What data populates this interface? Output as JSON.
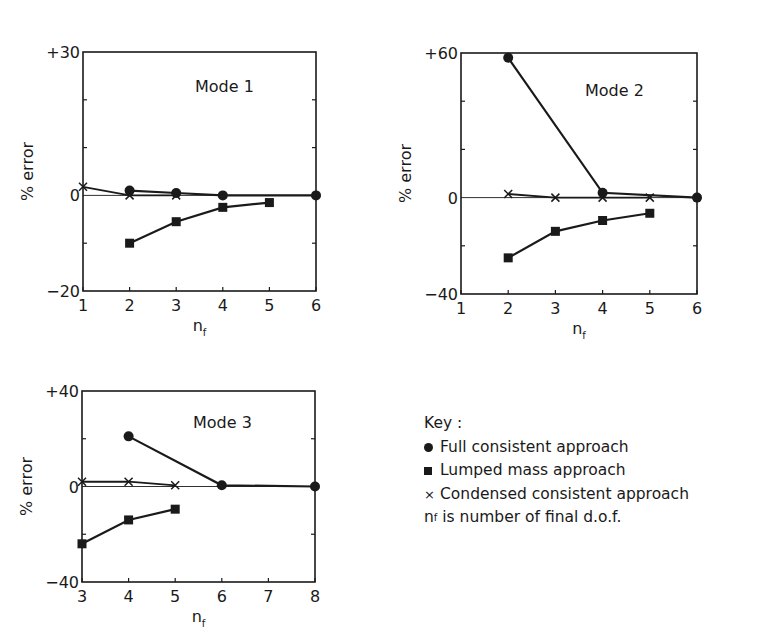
{
  "chart_data": [
    {
      "type": "line",
      "title": "Mode 1",
      "xlabel": "n_f",
      "ylabel": "% error",
      "xlim": [
        1,
        6
      ],
      "ylim": [
        -20,
        30
      ],
      "x_ticks": [
        1,
        2,
        3,
        4,
        5,
        6
      ],
      "y_tick_labels": [
        "+30",
        "0",
        "-20"
      ],
      "y_minor_ticks": [
        20,
        10,
        -10
      ],
      "grid": false,
      "zero_line": true,
      "box": {
        "x0": 83,
        "y0": 52,
        "x1": 316,
        "y1": 291
      },
      "title_pos": {
        "x": 195,
        "y": 92
      },
      "series": [
        {
          "name": "Full consistent approach",
          "marker": "circle",
          "x": [
            2,
            3,
            4,
            6
          ],
          "y": [
            1,
            0.5,
            0,
            0
          ]
        },
        {
          "name": "Lumped mass approach",
          "marker": "square",
          "x": [
            2,
            3,
            4,
            5
          ],
          "y": [
            -10,
            -5.5,
            -2.5,
            -1.5
          ]
        },
        {
          "name": "Condensed consistent approach",
          "marker": "cross",
          "x": [
            1,
            2,
            3
          ],
          "y": [
            1.8,
            0,
            0
          ]
        }
      ]
    },
    {
      "type": "line",
      "title": "Mode 2",
      "xlabel": "n_f",
      "ylabel": "% error",
      "xlim": [
        1,
        6
      ],
      "ylim": [
        -40,
        60
      ],
      "x_ticks": [
        1,
        2,
        3,
        4,
        5,
        6
      ],
      "y_tick_labels": [
        "+60",
        "0",
        "-40"
      ],
      "y_minor_ticks": [
        40,
        20,
        -20
      ],
      "grid": false,
      "zero_line": true,
      "box": {
        "x0": 461,
        "y0": 53,
        "x1": 697,
        "y1": 294
      },
      "title_pos": {
        "x": 585,
        "y": 96
      },
      "series": [
        {
          "name": "Full consistent approach",
          "marker": "circle",
          "x": [
            2,
            4,
            6
          ],
          "y": [
            58,
            2,
            0
          ]
        },
        {
          "name": "Lumped mass approach",
          "marker": "square",
          "x": [
            2,
            3,
            4,
            5
          ],
          "y": [
            -25,
            -14,
            -9.5,
            -6.5
          ]
        },
        {
          "name": "Condensed consistent approach",
          "marker": "cross",
          "x": [
            2,
            3,
            4,
            5
          ],
          "y": [
            1.5,
            0,
            0,
            0
          ]
        }
      ]
    },
    {
      "type": "line",
      "title": "Mode 3",
      "xlabel": "n_f",
      "ylabel": "% error",
      "xlim": [
        3,
        8
      ],
      "ylim": [
        -40,
        40
      ],
      "x_ticks": [
        3,
        4,
        5,
        6,
        7,
        8
      ],
      "y_tick_labels": [
        "+40",
        "0",
        "-40"
      ],
      "y_minor_ticks": [
        20,
        -20
      ],
      "grid": false,
      "zero_line": true,
      "box": {
        "x0": 82,
        "y0": 391,
        "x1": 315,
        "y1": 582
      },
      "title_pos": {
        "x": 193,
        "y": 428
      },
      "series": [
        {
          "name": "Full consistent approach",
          "marker": "circle",
          "x": [
            4,
            6,
            8
          ],
          "y": [
            21,
            0.5,
            0
          ]
        },
        {
          "name": "Lumped mass approach",
          "marker": "square",
          "x": [
            3,
            4,
            5
          ],
          "y": [
            -24,
            -14,
            -9.5
          ]
        },
        {
          "name": "Condensed consistent approach",
          "marker": "cross",
          "x": [
            3,
            4,
            5
          ],
          "y": [
            2,
            2,
            0.5
          ]
        }
      ]
    }
  ],
  "key": {
    "title": "Key :",
    "items": [
      {
        "marker": "circle",
        "label": "Full consistent approach"
      },
      {
        "marker": "square",
        "label": "Lumped mass approach"
      },
      {
        "marker": "cross",
        "label": "Condensed consistent approach"
      }
    ],
    "note_symbol": "n",
    "note_subscript": "f",
    "note_text": " is number of final d.o.f."
  },
  "colors": {
    "ink": "#1a1a1a",
    "background": "#ffffff"
  }
}
